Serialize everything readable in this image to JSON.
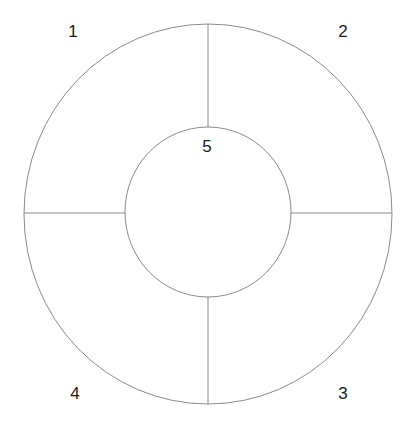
{
  "diagram": {
    "type": "segmented-ring",
    "colors": {
      "stroke": "#8a8a8a",
      "label": "#1a1a1a",
      "background": "#ffffff"
    },
    "outer": {
      "cx": 208,
      "cy": 214,
      "rx": 184,
      "ry": 190
    },
    "inner": {
      "cx": 208,
      "cy": 212,
      "rx": 83,
      "ry": 85
    },
    "segments": [
      {
        "id": "1",
        "label": "1",
        "position": "top-left",
        "label_x": 73,
        "label_y": 37
      },
      {
        "id": "2",
        "label": "2",
        "position": "top-right",
        "label_x": 343,
        "label_y": 37
      },
      {
        "id": "3",
        "label": "3",
        "position": "bottom-right",
        "label_x": 343,
        "label_y": 399
      },
      {
        "id": "4",
        "label": "4",
        "position": "bottom-left",
        "label_x": 75,
        "label_y": 399
      },
      {
        "id": "5",
        "label": "5",
        "position": "center",
        "label_x": 207,
        "label_y": 152
      }
    ]
  }
}
